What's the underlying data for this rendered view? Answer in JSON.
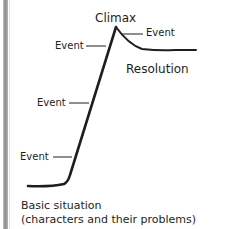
{
  "diagram": {
    "type": "plot-structure-diagram",
    "labels": {
      "climax": "Climax",
      "event_right": "Event",
      "event_upper": "Event",
      "event_middle": "Event",
      "event_lower": "Event",
      "resolution": "Resolution",
      "basic_situation_line1": "Basic situation",
      "basic_situation_line2": "(characters and their problems)"
    },
    "colors": {
      "line": "#1e1e1e",
      "text": "#1e1e1e",
      "background": "#ffffff",
      "left_bar": "#8a8a8a"
    }
  }
}
